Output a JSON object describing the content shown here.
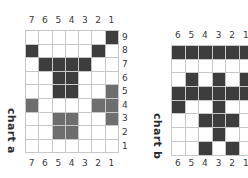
{
  "colors": {
    "dark": "#3d3d3d",
    "medium": "#6e6e6e",
    "empty": "#ffffff",
    "grid_line": "#c8c8c8"
  },
  "chart_a": {
    "title": "chart a",
    "column_labels": [
      "7",
      "6",
      "5",
      "4",
      "3",
      "2",
      "1"
    ],
    "row_labels": [
      "9",
      "8",
      "7",
      "6",
      "5",
      "4",
      "3",
      "2",
      "1"
    ],
    "cells": [
      [
        0,
        0,
        0,
        0,
        0,
        0,
        2
      ],
      [
        2,
        0,
        0,
        0,
        0,
        2,
        0
      ],
      [
        0,
        2,
        2,
        2,
        2,
        0,
        0
      ],
      [
        0,
        0,
        2,
        2,
        0,
        0,
        0
      ],
      [
        0,
        0,
        2,
        2,
        0,
        0,
        1
      ],
      [
        1,
        0,
        0,
        0,
        0,
        1,
        1
      ],
      [
        0,
        0,
        1,
        1,
        0,
        0,
        1
      ],
      [
        0,
        0,
        1,
        1,
        0,
        0,
        0
      ],
      [
        0,
        0,
        0,
        0,
        0,
        0,
        0
      ]
    ]
  },
  "chart_b": {
    "title": "chart b",
    "column_labels": [
      "6",
      "5",
      "4",
      "3",
      "2",
      "1"
    ],
    "cells": [
      [
        2,
        2,
        2,
        2,
        2,
        2
      ],
      [
        0,
        0,
        0,
        0,
        0,
        0
      ],
      [
        0,
        2,
        0,
        2,
        0,
        2
      ],
      [
        2,
        2,
        2,
        2,
        2,
        2
      ],
      [
        2,
        0,
        0,
        2,
        0,
        0
      ],
      [
        0,
        0,
        2,
        2,
        2,
        0
      ],
      [
        0,
        0,
        0,
        2,
        0,
        0
      ],
      [
        0,
        0,
        2,
        0,
        2,
        0
      ]
    ]
  },
  "legend": {
    "cell_values": {
      "0": "empty",
      "1": "medium",
      "2": "dark"
    }
  }
}
